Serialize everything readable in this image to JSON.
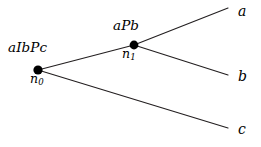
{
  "diagram": {
    "type": "derivation-tree",
    "background_color": "#ffffff",
    "line_color": "#231f20",
    "node_color": "#000000",
    "nodes": [
      {
        "id": "n0",
        "name": "n_0",
        "name_base": "n",
        "name_sub": "0",
        "state_label": "aIbPc",
        "x": 38,
        "y": 70
      },
      {
        "id": "n1",
        "name": "n_1",
        "name_base": "n",
        "name_sub": "1",
        "state_label": "aPb",
        "x": 134,
        "y": 45
      }
    ],
    "leaves": [
      {
        "id": "leaf-a",
        "label": "a",
        "x": 228,
        "y": 8
      },
      {
        "id": "leaf-b",
        "label": "b",
        "x": 228,
        "y": 75
      },
      {
        "id": "leaf-c",
        "label": "c",
        "x": 228,
        "y": 128
      }
    ],
    "edges": [
      {
        "id": "edge-n0-n1",
        "from": "n0",
        "to": "n1",
        "x1": 38,
        "y1": 70,
        "x2": 134,
        "y2": 45
      },
      {
        "id": "edge-n1-a",
        "from": "n1",
        "to": "leaf-a",
        "x1": 134,
        "y1": 45,
        "x2": 228,
        "y2": 8
      },
      {
        "id": "edge-n1-b",
        "from": "n1",
        "to": "leaf-b",
        "x1": 134,
        "y1": 45,
        "x2": 228,
        "y2": 75
      },
      {
        "id": "edge-n0-c",
        "from": "n0",
        "to": "leaf-c",
        "x1": 38,
        "y1": 70,
        "x2": 228,
        "y2": 128
      }
    ]
  }
}
